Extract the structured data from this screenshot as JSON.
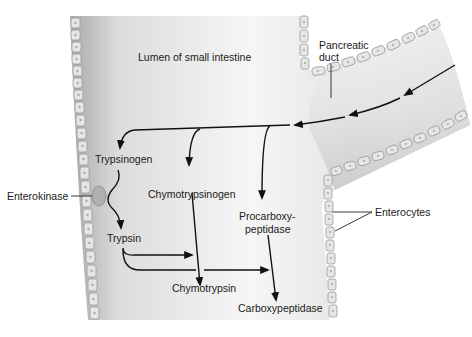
{
  "labels": {
    "lumen": "Lumen of small intestine",
    "pancreatic_duct_line1": "Pancreatic",
    "pancreatic_duct_line2": "duct",
    "enterokinase": "Enterokinase",
    "enterocytes": "Enterocytes",
    "trypsinogen": "Trypsinogen",
    "trypsin": "Trypsin",
    "chymotrypsinogen": "Chymotrypsinogen",
    "chymotrypsin": "Chymotrypsin",
    "procarboxypeptidase_line1": "Procarboxy-",
    "procarboxypeptidase_line2": "peptidase",
    "carboxypeptidase": "Carboxypeptidase"
  },
  "colors": {
    "lumen_light": "#f4f4f4",
    "lumen_dark": "#b8b8b8",
    "cell_fill": "#e6e6e6",
    "cell_stroke": "#9a9a9a",
    "ink": "#111111"
  },
  "pathways": [
    {
      "from": "Pancreatic duct",
      "to": [
        "Trypsinogen",
        "Chymotrypsinogen",
        "Procarboxypeptidase"
      ]
    },
    {
      "from": "Trypsinogen",
      "to": "Trypsin",
      "catalyst": "Enterokinase"
    },
    {
      "from": "Chymotrypsinogen",
      "to": "Chymotrypsin",
      "catalyst": "Trypsin"
    },
    {
      "from": "Procarboxypeptidase",
      "to": "Carboxypeptidase",
      "catalyst": "Trypsin"
    }
  ]
}
